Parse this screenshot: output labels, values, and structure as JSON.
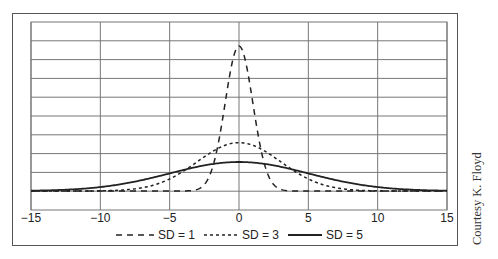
{
  "chart_data": {
    "type": "line",
    "title": "",
    "xlabel": "",
    "ylabel": "",
    "xlim": [
      -15,
      15
    ],
    "ylim": [
      0,
      0.5
    ],
    "grid": true,
    "grid_x_ticks": [
      -15,
      -10,
      -5,
      0,
      5,
      10,
      15
    ],
    "grid_y_lines": 10,
    "x_tick_labels": [
      "−15",
      "−10",
      "−5",
      "0",
      "5",
      "10",
      "15"
    ],
    "y_tick_labels": [],
    "legend_position": "bottom",
    "x": [
      -15,
      -12,
      -10,
      -8,
      -6,
      -5,
      -4,
      -3,
      -2,
      -1,
      0,
      1,
      2,
      3,
      4,
      5,
      6,
      8,
      10,
      12,
      15
    ],
    "series": [
      {
        "name": "SD = 1",
        "style": "dashed",
        "mean": 0,
        "sd": 1,
        "values": [
          0,
          0,
          0,
          0,
          0,
          1.5e-06,
          0.00013,
          0.0044,
          0.054,
          0.242,
          0.399,
          0.242,
          0.054,
          0.0044,
          0.00013,
          1.5e-06,
          0,
          0,
          0,
          0,
          0
        ]
      },
      {
        "name": "SD = 3",
        "style": "dotted",
        "mean": 0,
        "sd": 3,
        "values": [
          5e-07,
          4e-05,
          0.00051,
          0.0038,
          0.018,
          0.033,
          0.055,
          0.081,
          0.106,
          0.126,
          0.133,
          0.126,
          0.106,
          0.081,
          0.055,
          0.033,
          0.018,
          0.0038,
          0.00051,
          4e-05,
          5e-07
        ]
      },
      {
        "name": "SD = 5",
        "style": "solid",
        "mean": 0,
        "sd": 5,
        "values": [
          0.0009,
          0.0045,
          0.0108,
          0.0222,
          0.0389,
          0.0484,
          0.0579,
          0.0666,
          0.0737,
          0.0782,
          0.0798,
          0.0782,
          0.0737,
          0.0666,
          0.0579,
          0.0484,
          0.0389,
          0.0222,
          0.0108,
          0.0045,
          0.0009
        ]
      }
    ],
    "annotations": [
      "Courtesy K. Floyd"
    ]
  },
  "legend": {
    "items": [
      {
        "label": "SD = 1",
        "style": "dashed"
      },
      {
        "label": "SD = 3",
        "style": "dotted"
      },
      {
        "label": "SD = 5",
        "style": "solid"
      }
    ]
  },
  "credit": "Courtesy K. Floyd",
  "colors": {
    "line": "#222222",
    "grid": "#777777",
    "frame": "#555555"
  }
}
